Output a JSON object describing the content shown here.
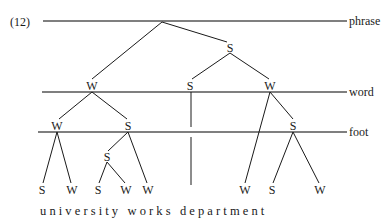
{
  "figure": {
    "example_number": "(12)",
    "utterance": "u n i v e r s i t y   w o r k s   d e p a r t m e n t",
    "words": [
      "university",
      "works",
      "department"
    ],
    "line_color": "#555555",
    "branch_color": "#1a1a1a",
    "text_color": "#1a1a1a",
    "background_color": "#ffffff"
  },
  "tiers": [
    {
      "id": "phrase",
      "label": "phrase",
      "y": 21,
      "x_start": 43,
      "x_end": 347
    },
    {
      "id": "word",
      "label": "word",
      "y": 92,
      "x_start": 42,
      "x_end": 347
    },
    {
      "id": "foot",
      "label": "foot",
      "y": 132,
      "x_start": 38,
      "x_end": 347
    }
  ],
  "tier_label_x": 349,
  "nodes": [
    {
      "id": "root",
      "label": "",
      "x": 162,
      "y": 21,
      "tier": "phrase"
    },
    {
      "id": "s-phrase",
      "label": "S",
      "x": 230,
      "y": 48,
      "tier": "phrase-internal"
    },
    {
      "id": "w-word-1",
      "label": "W",
      "x": 92,
      "y": 86,
      "tier": "word"
    },
    {
      "id": "s-word-1",
      "label": "S",
      "x": 190,
      "y": 86,
      "tier": "word"
    },
    {
      "id": "w-word-2",
      "label": "W",
      "x": 270,
      "y": 86,
      "tier": "word"
    },
    {
      "id": "w-foot-1",
      "label": "W",
      "x": 57,
      "y": 126,
      "tier": "foot"
    },
    {
      "id": "s-foot-1",
      "label": "S",
      "x": 128,
      "y": 126,
      "tier": "foot"
    },
    {
      "id": "s-foot-2",
      "label": "S",
      "x": 293,
      "y": 126,
      "tier": "foot"
    },
    {
      "id": "s-inner",
      "label": "S",
      "x": 107,
      "y": 157,
      "tier": "below-foot"
    }
  ],
  "leaves": [
    {
      "id": "leaf-1",
      "label": "S",
      "x": 42,
      "y": 190
    },
    {
      "id": "leaf-2",
      "label": "W",
      "x": 72,
      "y": 190
    },
    {
      "id": "leaf-3",
      "label": "S",
      "x": 98,
      "y": 190
    },
    {
      "id": "leaf-4",
      "label": "W",
      "x": 126,
      "y": 190
    },
    {
      "id": "leaf-5",
      "label": "W",
      "x": 148,
      "y": 190
    },
    {
      "id": "leaf-6",
      "label": "W",
      "x": 245,
      "y": 190
    },
    {
      "id": "leaf-7",
      "label": "S",
      "x": 272,
      "y": 190
    },
    {
      "id": "leaf-8",
      "label": "W",
      "x": 320,
      "y": 190
    }
  ],
  "branches": [
    {
      "from": "root",
      "to": "w-word-1",
      "x1": 162,
      "y1": 22,
      "x2": 92,
      "y2": 79
    },
    {
      "from": "root",
      "to": "s-phrase",
      "x1": 162,
      "y1": 22,
      "x2": 227,
      "y2": 42
    },
    {
      "from": "s-phrase",
      "to": "s-word-1",
      "x1": 230,
      "y1": 53,
      "x2": 192,
      "y2": 79
    },
    {
      "from": "s-phrase",
      "to": "w-word-2",
      "x1": 230,
      "y1": 53,
      "x2": 269,
      "y2": 79
    },
    {
      "from": "w-word-1",
      "to": "w-foot-1",
      "x1": 92,
      "y1": 92,
      "x2": 59,
      "y2": 119
    },
    {
      "from": "w-word-1",
      "to": "s-foot-1",
      "x1": 92,
      "y1": 92,
      "x2": 127,
      "y2": 119
    },
    {
      "from": "s-word-1",
      "to": "works-upper",
      "x1": 191,
      "y1": 92,
      "x2": 191,
      "y2": 127
    },
    {
      "from": "works-upper",
      "to": "leaf-works",
      "x1": 191,
      "y1": 137,
      "x2": 191,
      "y2": 185
    },
    {
      "from": "w-word-2",
      "to": "leaf-6",
      "x1": 270,
      "y1": 92,
      "x2": 245,
      "y2": 183
    },
    {
      "from": "w-word-2",
      "to": "s-foot-2",
      "x1": 270,
      "y1": 92,
      "x2": 293,
      "y2": 119
    },
    {
      "from": "w-foot-1",
      "to": "leaf-1",
      "x1": 57,
      "y1": 132,
      "x2": 43,
      "y2": 183
    },
    {
      "from": "w-foot-1",
      "to": "leaf-2",
      "x1": 57,
      "y1": 132,
      "x2": 71,
      "y2": 183
    },
    {
      "from": "s-foot-1",
      "to": "s-inner",
      "x1": 128,
      "y1": 132,
      "x2": 108,
      "y2": 151
    },
    {
      "from": "s-foot-1",
      "to": "leaf-5",
      "x1": 128,
      "y1": 132,
      "x2": 147,
      "y2": 183
    },
    {
      "from": "s-inner",
      "to": "leaf-3",
      "x1": 107,
      "y1": 162,
      "x2": 99,
      "y2": 183
    },
    {
      "from": "s-inner",
      "to": "leaf-4",
      "x1": 107,
      "y1": 162,
      "x2": 125,
      "y2": 183
    },
    {
      "from": "s-foot-2",
      "to": "leaf-7",
      "x1": 293,
      "y1": 132,
      "x2": 273,
      "y2": 183
    },
    {
      "from": "s-foot-2",
      "to": "leaf-8",
      "x1": 293,
      "y1": 132,
      "x2": 319,
      "y2": 183
    }
  ],
  "utterance_position": {
    "x": 40,
    "y": 205
  },
  "example_number_position": {
    "x": 10,
    "y": 15
  }
}
